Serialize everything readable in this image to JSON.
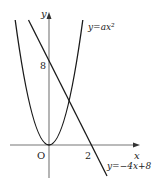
{
  "figure": {
    "axes": {
      "x_label": "x",
      "y_label": "y",
      "origin_label": "O",
      "x_tick_label": "2",
      "y_tick_label": "8"
    },
    "curves": [
      {
        "name": "parabola",
        "equation_label": "y=ax²"
      },
      {
        "name": "line",
        "equation_label": "y=−4x+8"
      }
    ],
    "colors": {
      "stroke": "#1a1a1a",
      "axis": "#666666"
    }
  }
}
